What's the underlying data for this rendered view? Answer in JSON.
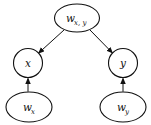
{
  "page": {
    "background": "#ffffff"
  },
  "diagram": {
    "type": "directed-graph",
    "stroke_color": "#111111",
    "node_fill": "#ffffff",
    "nodes": {
      "w_xy": {
        "main": "w",
        "sub": "x, y"
      },
      "x": {
        "main": "x",
        "sub": ""
      },
      "y": {
        "main": "y",
        "sub": ""
      },
      "w_x": {
        "main": "w",
        "sub": "x"
      },
      "w_y": {
        "main": "w",
        "sub": "y"
      }
    },
    "edges": [
      {
        "from": "w_xy",
        "to": "x"
      },
      {
        "from": "w_xy",
        "to": "y"
      },
      {
        "from": "w_x",
        "to": "x"
      },
      {
        "from": "w_y",
        "to": "y"
      }
    ]
  }
}
